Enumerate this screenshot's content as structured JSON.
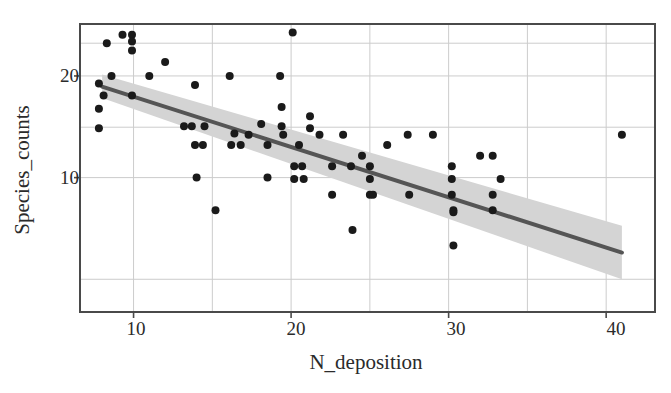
{
  "chart_data": {
    "type": "scatter",
    "title": "",
    "xlabel": "N_deposition",
    "ylabel": "Species_counts",
    "xlim": [
      6.6,
      43.1
    ],
    "ylim": [
      4.0,
      28.5
    ],
    "yscale": "log",
    "xscale": "linear",
    "grid": true,
    "legend": null,
    "x_ticks": [
      10,
      20,
      30,
      40
    ],
    "x_tick_labels": [
      "10",
      "20",
      "30",
      "40"
    ],
    "x_minor_ticks": [
      15,
      25,
      35
    ],
    "y_ticks": [
      10,
      20
    ],
    "y_tick_labels": [
      "10",
      "20"
    ],
    "y_gridlines": [
      5,
      10,
      14.1,
      20,
      25
    ],
    "marker": {
      "shape": "circle",
      "color": "#1a1a1a",
      "size_px": 8
    },
    "points": [
      {
        "x": 7.8,
        "y": 19.0
      },
      {
        "x": 7.8,
        "y": 16.0
      },
      {
        "x": 7.8,
        "y": 14.0
      },
      {
        "x": 8.1,
        "y": 17.5
      },
      {
        "x": 8.3,
        "y": 25.0
      },
      {
        "x": 8.6,
        "y": 20.0
      },
      {
        "x": 9.3,
        "y": 26.5
      },
      {
        "x": 9.9,
        "y": 26.5
      },
      {
        "x": 9.9,
        "y": 25.3
      },
      {
        "x": 9.9,
        "y": 23.8
      },
      {
        "x": 9.9,
        "y": 17.5
      },
      {
        "x": 11.0,
        "y": 20.0
      },
      {
        "x": 12.0,
        "y": 22.0
      },
      {
        "x": 13.2,
        "y": 14.2
      },
      {
        "x": 13.7,
        "y": 14.2
      },
      {
        "x": 13.9,
        "y": 18.8
      },
      {
        "x": 13.9,
        "y": 12.5
      },
      {
        "x": 14.0,
        "y": 10.0
      },
      {
        "x": 14.4,
        "y": 12.5
      },
      {
        "x": 14.5,
        "y": 14.2
      },
      {
        "x": 15.2,
        "y": 8.0
      },
      {
        "x": 16.1,
        "y": 20.0
      },
      {
        "x": 16.2,
        "y": 12.5
      },
      {
        "x": 16.4,
        "y": 13.5
      },
      {
        "x": 16.8,
        "y": 12.5
      },
      {
        "x": 17.3,
        "y": 13.4
      },
      {
        "x": 18.1,
        "y": 14.4
      },
      {
        "x": 18.5,
        "y": 12.5
      },
      {
        "x": 18.5,
        "y": 10.0
      },
      {
        "x": 19.3,
        "y": 20.0
      },
      {
        "x": 19.4,
        "y": 16.2
      },
      {
        "x": 19.4,
        "y": 14.2
      },
      {
        "x": 19.5,
        "y": 13.4
      },
      {
        "x": 20.1,
        "y": 26.9
      },
      {
        "x": 20.2,
        "y": 10.8
      },
      {
        "x": 20.2,
        "y": 9.9
      },
      {
        "x": 20.5,
        "y": 12.5
      },
      {
        "x": 20.7,
        "y": 10.8
      },
      {
        "x": 20.8,
        "y": 9.9
      },
      {
        "x": 21.2,
        "y": 15.2
      },
      {
        "x": 21.2,
        "y": 14.0
      },
      {
        "x": 21.8,
        "y": 13.4
      },
      {
        "x": 22.6,
        "y": 10.8
      },
      {
        "x": 22.6,
        "y": 8.9
      },
      {
        "x": 23.3,
        "y": 13.4
      },
      {
        "x": 23.8,
        "y": 10.8
      },
      {
        "x": 23.9,
        "y": 7.0
      },
      {
        "x": 24.5,
        "y": 11.6
      },
      {
        "x": 25.0,
        "y": 10.8
      },
      {
        "x": 25.0,
        "y": 9.9
      },
      {
        "x": 25.0,
        "y": 8.9
      },
      {
        "x": 25.2,
        "y": 8.9
      },
      {
        "x": 26.1,
        "y": 12.5
      },
      {
        "x": 27.4,
        "y": 13.4
      },
      {
        "x": 27.5,
        "y": 8.9
      },
      {
        "x": 29.0,
        "y": 13.4
      },
      {
        "x": 30.2,
        "y": 10.8
      },
      {
        "x": 30.2,
        "y": 9.9
      },
      {
        "x": 30.2,
        "y": 8.9
      },
      {
        "x": 30.3,
        "y": 8.0
      },
      {
        "x": 30.3,
        "y": 7.9
      },
      {
        "x": 30.3,
        "y": 6.3
      },
      {
        "x": 32.0,
        "y": 11.6
      },
      {
        "x": 32.8,
        "y": 11.6
      },
      {
        "x": 32.8,
        "y": 8.9
      },
      {
        "x": 32.8,
        "y": 8.0
      },
      {
        "x": 33.3,
        "y": 9.9
      },
      {
        "x": 41.0,
        "y": 13.4
      }
    ],
    "regression": {
      "type": "linear-fit-on-log-y",
      "line_color": "#555555",
      "line_width_px": 4,
      "band_color": "#d4d4d4",
      "band_label": "confidence interval",
      "x_start": 8.0,
      "x_end": 41.0,
      "y_at_x_start": 18.6,
      "y_at_x_end": 6.0,
      "band_lower_at_x_start": 17.2,
      "band_upper_at_x_start": 20.2,
      "band_lower_at_x_end": 5.0,
      "band_upper_at_x_end": 7.2
    }
  },
  "axes": {
    "frame_color": "#4a4a4a",
    "grid_color": "#cccccc",
    "background": "#ffffff"
  }
}
